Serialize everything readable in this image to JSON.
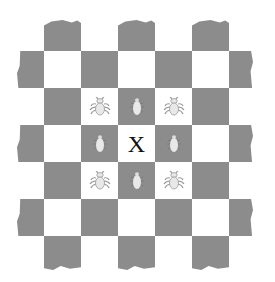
{
  "board": {
    "rows": 7,
    "cols": 7,
    "cell_size": 37,
    "origin": {
      "x": 7,
      "y": 14
    },
    "colors": {
      "dark": "#8c8c8c",
      "light": "#ffffff",
      "bug_body": "#e8e8e8",
      "bug_legs": "#9a9a9a"
    },
    "center_mark": {
      "row": 3,
      "col": 3,
      "label": "X"
    },
    "bugs": [
      {
        "row": 2,
        "col": 2,
        "icon": "spider-bug-icon"
      },
      {
        "row": 2,
        "col": 3,
        "icon": "bug-icon"
      },
      {
        "row": 2,
        "col": 4,
        "icon": "spider-bug-icon"
      },
      {
        "row": 3,
        "col": 2,
        "icon": "bug-icon"
      },
      {
        "row": 3,
        "col": 4,
        "icon": "bug-icon"
      },
      {
        "row": 4,
        "col": 2,
        "icon": "spider-bug-icon"
      },
      {
        "row": 4,
        "col": 3,
        "icon": "bug-icon"
      },
      {
        "row": 4,
        "col": 4,
        "icon": "spider-bug-icon"
      }
    ]
  }
}
